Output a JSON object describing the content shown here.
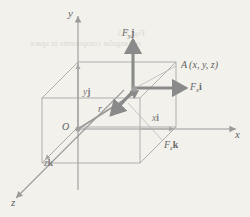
{
  "figure": {
    "type": "3d-vector-diagram",
    "background_color": "#f2f1ec",
    "line_color": "#9a9a9a",
    "vector_color": "#8a8a8a",
    "text_color": "#6d6d6d"
  },
  "axes": {
    "x_label": "x",
    "y_label": "y",
    "z_label": "z"
  },
  "points": {
    "origin_label": "O",
    "point_a_label": "A",
    "point_a_coords": "(x, y, z)"
  },
  "position_vector": {
    "label": "r"
  },
  "components": {
    "x_component": {
      "scalar": "x",
      "unit": "i"
    },
    "y_component": {
      "scalar": "y",
      "unit": "j"
    },
    "z_component": {
      "scalar": "z",
      "unit": "k"
    }
  },
  "forces": {
    "fx": {
      "symbol": "F",
      "sub": "x",
      "unit": "i"
    },
    "fy": {
      "symbol": "F",
      "sub": "y",
      "unit": "j"
    },
    "fz": {
      "symbol": "F",
      "sub": "z",
      "unit": "k"
    }
  },
  "ghost_text": {
    "line1": "Fig. 2-5",
    "line2": "rectangular components in space"
  }
}
